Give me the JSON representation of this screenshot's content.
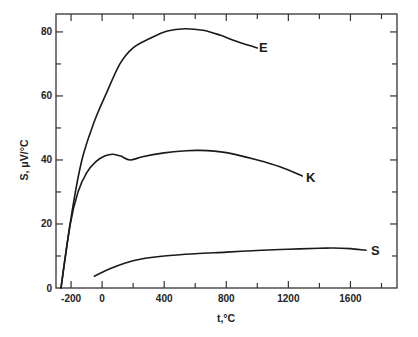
{
  "chart_data": {
    "type": "line",
    "title": "",
    "xlabel": "t,°C",
    "ylabel": "S, μV/°C",
    "xlim": [
      -297,
      1900
    ],
    "ylim": [
      0,
      85.6
    ],
    "grid": false,
    "legend": "inline labels at curve ends",
    "x_ticks": [
      -200,
      0,
      400,
      800,
      1200,
      1600
    ],
    "x_minor_ticks": [
      200,
      600,
      1000,
      1400,
      1800
    ],
    "y_ticks": [
      0,
      20,
      40,
      60,
      80
    ],
    "y_minor_ticks": [
      10,
      30,
      50,
      70
    ],
    "series": [
      {
        "name": "E",
        "x": [
          -265,
          -200,
          -130,
          -50,
          20,
          115,
          200,
          310,
          420,
          535,
          650,
          760,
          870,
          1000
        ],
        "values": [
          0,
          22,
          40,
          52,
          60,
          70,
          75,
          78,
          80.3,
          81,
          80.5,
          79,
          77,
          75
        ]
      },
      {
        "name": "K",
        "x": [
          -265,
          -205,
          -155,
          -100,
          -40,
          20,
          70,
          120,
          180,
          260,
          400,
          520,
          630,
          800,
          1000,
          1150,
          1290
        ],
        "values": [
          0,
          20,
          30,
          36,
          39.5,
          41.3,
          41.8,
          41.2,
          40,
          41,
          42.2,
          42.8,
          43,
          42.3,
          40,
          37.8,
          35
        ]
      },
      {
        "name": "S",
        "x": [
          -50,
          50,
          150,
          245,
          400,
          600,
          800,
          1000,
          1200,
          1400,
          1490,
          1600,
          1700
        ],
        "values": [
          3.7,
          6,
          7.8,
          9,
          10,
          10.7,
          11.2,
          11.7,
          12.1,
          12.4,
          12.5,
          12.3,
          11.8
        ]
      }
    ]
  },
  "labels": {
    "x_axis": "t,°C",
    "y_axis": "S, μV/°C",
    "series_E": "E",
    "series_K": "K",
    "series_S": "S",
    "x_tick_labels": [
      "-200",
      "0",
      "400",
      "800",
      "1200",
      "1600"
    ],
    "y_tick_labels": [
      "0",
      "20",
      "40",
      "60",
      "80"
    ]
  }
}
